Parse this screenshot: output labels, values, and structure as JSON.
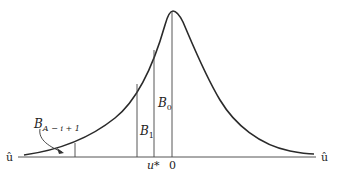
{
  "diagram": {
    "axis_left_label": "û",
    "axis_right_label": "û",
    "tick_labels": {
      "u_star": "u*",
      "zero": "0"
    },
    "bar_labels": {
      "b0": {
        "base": "B",
        "sub": "0"
      },
      "b1": {
        "base": "B",
        "sub": "1"
      },
      "bk": {
        "base": "B",
        "sub": "A − i + 1"
      }
    },
    "colors": {
      "curve": "#2a2a2a",
      "axis": "#555555",
      "bars": "#444444"
    }
  }
}
